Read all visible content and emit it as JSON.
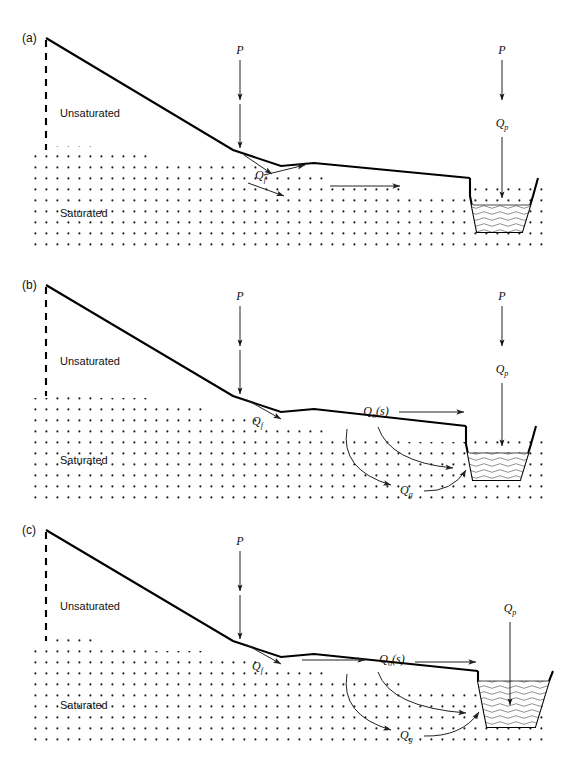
{
  "figure": {
    "type": "schematic-diagram",
    "panel_count": 3
  },
  "labels": {
    "unsaturated": "Unsaturated",
    "saturated": "Saturated",
    "precipitation": "P",
    "infiltration_q": "Q",
    "infiltration_sub": "f",
    "channel_precip_q": "Q",
    "channel_precip_sub": "p",
    "overland_q": "Q",
    "overland_sub": "o",
    "overland_arg": "(s)",
    "groundwater_q": "Q",
    "groundwater_sub": "g"
  },
  "panels": [
    {
      "id": "a",
      "tag": "(a)",
      "caption_tag": "(a)",
      "fluxes": [
        "P",
        "Qf",
        "Qp"
      ],
      "channel_state": "low-flow",
      "has_overland_flow": false,
      "has_groundwater_flow": false
    },
    {
      "id": "b",
      "tag": "(b)",
      "caption_tag": "(b)",
      "fluxes": [
        "P",
        "Qf",
        "Qo(s)",
        "Qg",
        "Qp"
      ],
      "channel_state": "partly-full",
      "has_overland_flow": true,
      "has_groundwater_flow": true
    },
    {
      "id": "c",
      "tag": "(c)",
      "caption_tag": "(c)",
      "fluxes": [
        "P",
        "Qf",
        "Qo(s)",
        "Qg",
        "Qp"
      ],
      "channel_state": "bank-full",
      "has_overland_flow": true,
      "has_groundwater_flow": true
    }
  ],
  "colors": {
    "line": "#000000",
    "arrow": "#222222",
    "stipple": "#1a1a1a",
    "water": "#555555",
    "background": "#ffffff"
  }
}
